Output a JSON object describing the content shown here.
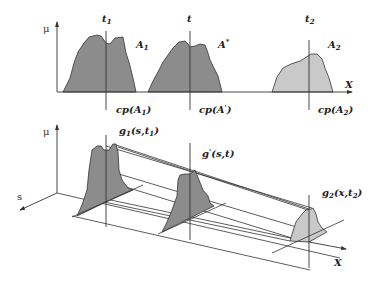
{
  "figure": {
    "type": "diagram",
    "colors": {
      "dark_fill": "#8c8c8c",
      "light_fill": "#c9c9c9",
      "stroke": "#333333",
      "background": "#ffffff"
    }
  },
  "top_panel": {
    "y_axis_label": "μ",
    "x_axis_label": "X",
    "sets": [
      {
        "name": "A1",
        "label_main": "A",
        "label_sub": "1",
        "time_label_main": "t",
        "time_label_sub": "1",
        "cp_label_pre": "cp(A",
        "cp_label_sub": "1",
        "cp_label_post": ")",
        "fill": "dark"
      },
      {
        "name": "A*",
        "label_main": "A",
        "label_sup": "*",
        "time_label_main": "t",
        "cp_label_pre": "cp(A",
        "cp_label_sup": "'",
        "cp_label_post": ")",
        "fill": "dark"
      },
      {
        "name": "A2",
        "label_main": "A",
        "label_sub": "2",
        "time_label_main": "t",
        "time_label_sub": "2",
        "cp_label_pre": "cp(A",
        "cp_label_sub": "2",
        "cp_label_post": ")",
        "fill": "light"
      }
    ]
  },
  "bottom_panel": {
    "y_axis_label": "μ",
    "depth_axis_label": "s",
    "x_axis_label": "X",
    "curves": [
      {
        "label_pre": "g",
        "label_sub": "1",
        "label_args": "(s,t",
        "label_args_sub": "1",
        "label_post": ")"
      },
      {
        "label_pre": "g",
        "label_sup": "'",
        "label_args": "(s,t",
        "label_post": ")"
      },
      {
        "label_pre": "g",
        "label_sub": "2",
        "label_args": "(x,t",
        "label_args_sub": "2",
        "label_post": ")"
      }
    ]
  }
}
